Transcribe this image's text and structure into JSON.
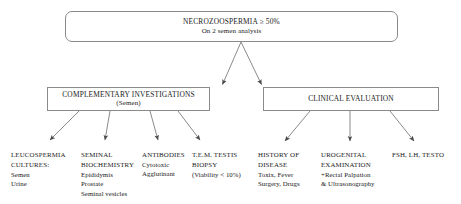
{
  "diagram": {
    "title_node": {
      "title": "NECROZOOSPERMIA ≥ 50%",
      "subtitle": "On 2 semen analysis"
    },
    "branches": [
      {
        "title": "COMPLEMENTARY INVESTIGATIONS",
        "subtitle": "(Semen)"
      },
      {
        "title": "CLINICAL EVALUATION",
        "subtitle": ""
      }
    ],
    "leaves": [
      {
        "head": [
          "LEUCOSPERMIA",
          "CULTURES:"
        ],
        "lines": [
          "Semen",
          "Urine"
        ]
      },
      {
        "head": [
          "SEMINAL",
          "BIOCHEMISTRY"
        ],
        "lines": [
          "Epididymis",
          "Prostate",
          "Seminal vesicles"
        ]
      },
      {
        "head": [
          "ANTIBODIES"
        ],
        "lines": [
          "Cytotoxic",
          "Agglutinant"
        ]
      },
      {
        "head": [
          "T.E.M. TESTIS",
          "BIOPSY"
        ],
        "lines": [
          "(Viability < 10%)"
        ]
      },
      {
        "head": [
          "HISTORY OF",
          "DISEASE"
        ],
        "lines": [
          "Toxix, Fever",
          "Surgery, Drugs"
        ]
      },
      {
        "head": [
          "UROGENITAL",
          "EXAMINATION"
        ],
        "lines": [
          "+Rectal Palpation",
          "& Ultrasonography"
        ]
      },
      {
        "head": [
          "FSH, LH, TESTO"
        ],
        "lines": []
      }
    ],
    "colors": {
      "stroke": "#8a8a8a",
      "connector": "#7d7d7d",
      "text": "#1a1a1a",
      "background": "#ffffff"
    }
  }
}
